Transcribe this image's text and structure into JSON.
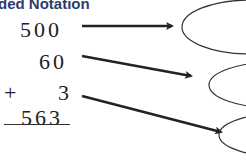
{
  "title": "ded Notation",
  "addends": [
    "500",
    "60",
    "3"
  ],
  "operator": "+",
  "sum": "563",
  "colors": {
    "title": "#2e3b6e",
    "ink": "#222222"
  },
  "ovals": [
    {
      "label": "",
      "empty": true
    },
    {
      "label": "",
      "empty": true
    },
    {
      "label": "",
      "empty": true
    }
  ]
}
